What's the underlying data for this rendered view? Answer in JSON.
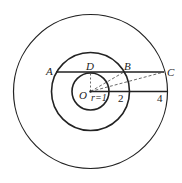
{
  "diagram": {
    "type": "concentric-circles",
    "center": {
      "label": "O"
    },
    "radius_label": "r=1",
    "circles": [
      {
        "name": "inner",
        "radius_value": 1
      },
      {
        "name": "middle",
        "radius_value": 2
      },
      {
        "name": "outer",
        "radius_value": 4
      }
    ],
    "points": {
      "A": "A",
      "B": "B",
      "C": "C",
      "D": "D",
      "O": "O"
    },
    "axis_labels": {
      "two": "2",
      "four": "4"
    },
    "segments": [
      {
        "from": "A",
        "to": "C",
        "style": "solid"
      },
      {
        "from": "O",
        "to": "4",
        "style": "solid"
      },
      {
        "from": "O",
        "to": "D",
        "style": "dashed"
      },
      {
        "from": "O",
        "to": "B",
        "style": "dashed"
      },
      {
        "from": "O",
        "to": "C",
        "style": "dashed"
      }
    ],
    "colors": {
      "stroke": "#222222",
      "background": "#ffffff"
    }
  }
}
